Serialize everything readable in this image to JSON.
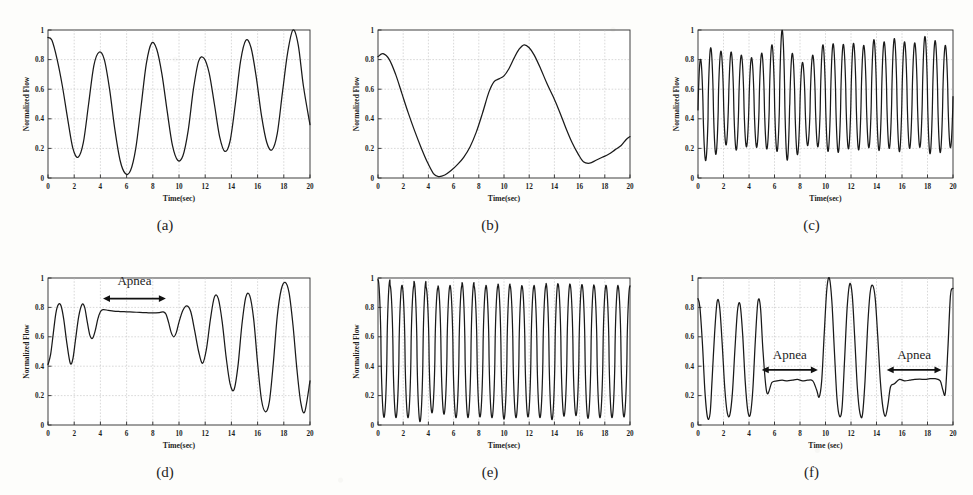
{
  "figure": {
    "background_color": "#fdfdfb",
    "trace_color": "#1a1a1a",
    "grid_color": "#b9b9b9",
    "frame_color": "#2b2b2b"
  },
  "axes_common": {
    "ylabel": "Normalized Flow",
    "xlabel": "Time(sec)",
    "xticks": [
      "0",
      "2",
      "4",
      "6",
      "8",
      "10",
      "12",
      "14",
      "16",
      "18",
      "20"
    ],
    "xtick_values": [
      0,
      2,
      4,
      6,
      8,
      10,
      12,
      14,
      16,
      18,
      20
    ],
    "yticks": [
      "0",
      "0.2",
      "0.4",
      "0.6",
      "0.8",
      "1"
    ],
    "ytick_values": [
      0,
      0.2,
      0.4,
      0.6,
      0.8,
      1
    ],
    "xlim": [
      0,
      20
    ],
    "ylim": [
      0,
      1
    ],
    "grid": true
  },
  "panels": [
    {
      "id": "a",
      "label": "(a)",
      "ylabel": "Normalized Flow",
      "xlabel": "Time(sec)",
      "show_ylabel": true,
      "annotations": [],
      "chart_data": {
        "type": "line",
        "title": "(a)",
        "xlabel": "Time(sec)",
        "ylabel": "Normalized Flow",
        "xlim": [
          0,
          20
        ],
        "ylim": [
          0,
          1
        ],
        "grid": true,
        "description": "Normal breathing, slow regular respiration, about 6 cycles in 20 seconds",
        "series": [
          {
            "name": "normalized flow",
            "x": [
              0.0,
              0.3,
              0.7,
              1.1,
              1.5,
              1.9,
              2.3,
              2.7,
              3.1,
              3.5,
              3.9,
              4.3,
              4.7,
              5.1,
              5.5,
              5.9,
              6.3,
              6.7,
              7.1,
              7.5,
              7.9,
              8.3,
              8.7,
              9.1,
              9.5,
              9.9,
              10.3,
              10.7,
              11.1,
              11.5,
              11.9,
              12.3,
              12.7,
              13.1,
              13.5,
              13.9,
              14.3,
              14.7,
              15.1,
              15.5,
              15.9,
              16.3,
              16.7,
              17.1,
              17.5,
              17.9,
              18.3,
              18.7,
              19.1,
              19.5,
              20.0
            ],
            "y": [
              0.95,
              0.93,
              0.8,
              0.62,
              0.4,
              0.2,
              0.14,
              0.24,
              0.5,
              0.76,
              0.85,
              0.8,
              0.6,
              0.33,
              0.12,
              0.03,
              0.05,
              0.2,
              0.48,
              0.77,
              0.91,
              0.87,
              0.7,
              0.45,
              0.22,
              0.12,
              0.15,
              0.32,
              0.6,
              0.79,
              0.81,
              0.71,
              0.5,
              0.28,
              0.18,
              0.25,
              0.5,
              0.79,
              0.93,
              0.88,
              0.68,
              0.42,
              0.24,
              0.19,
              0.3,
              0.58,
              0.85,
              1.0,
              0.9,
              0.62,
              0.36
            ]
          }
        ]
      }
    },
    {
      "id": "b",
      "label": "(b)",
      "ylabel": "Normalized Flow",
      "xlabel": "Time(sec)",
      "show_ylabel": true,
      "annotations": [],
      "chart_data": {
        "type": "line",
        "title": "(b)",
        "xlabel": "Time(sec)",
        "ylabel": "Normalized Flow",
        "xlim": [
          0,
          20
        ],
        "ylim": [
          0,
          1
        ],
        "grid": true,
        "description": "Very slow breathing, roughly one and a half long cycles over 20 seconds",
        "series": [
          {
            "name": "normalized flow",
            "x": [
              0.0,
              0.4,
              0.9,
              1.4,
              1.9,
              2.4,
              2.9,
              3.4,
              3.9,
              4.4,
              4.8,
              5.3,
              5.8,
              6.3,
              6.8,
              7.3,
              7.8,
              8.3,
              8.8,
              9.2,
              9.6,
              10.0,
              10.4,
              10.8,
              11.2,
              11.6,
              12.0,
              12.4,
              12.9,
              13.4,
              13.9,
              14.4,
              14.9,
              15.4,
              15.9,
              16.3,
              16.8,
              17.3,
              17.8,
              18.3,
              18.8,
              19.3,
              19.7,
              20.0
            ],
            "y": [
              0.82,
              0.84,
              0.8,
              0.7,
              0.57,
              0.44,
              0.32,
              0.21,
              0.11,
              0.03,
              0.01,
              0.02,
              0.05,
              0.09,
              0.14,
              0.21,
              0.31,
              0.44,
              0.58,
              0.65,
              0.67,
              0.69,
              0.74,
              0.81,
              0.87,
              0.9,
              0.88,
              0.83,
              0.74,
              0.64,
              0.55,
              0.45,
              0.34,
              0.24,
              0.16,
              0.11,
              0.1,
              0.12,
              0.14,
              0.16,
              0.19,
              0.22,
              0.26,
              0.28
            ]
          }
        ]
      }
    },
    {
      "id": "c",
      "label": "(c)",
      "ylabel": "Normalized Flow",
      "xlabel": "Time(sec)",
      "show_ylabel": true,
      "annotations": [],
      "chart_data": {
        "type": "line",
        "title": "(c)",
        "xlabel": "Time(sec)",
        "ylabel": "Normalized Flow",
        "xlim": [
          0,
          20
        ],
        "ylim": [
          0,
          1
        ],
        "grid": true,
        "description": "Rapid shallow breathing, about 25 fast cycles, amplitude between 0.1 and 1.0",
        "synth": {
          "mode": "oscillation",
          "cycles": 25,
          "baseline": 0.52,
          "amplitude": 0.36,
          "phase": 0.0,
          "amp_modulation": [
            0.95,
            1.0,
            0.88,
            0.92,
            0.86,
            0.84,
            0.9,
            1.0,
            1.22,
            0.95,
            0.78,
            0.86,
            1.0,
            1.02,
            0.98,
            1.0,
            0.96,
            1.04,
            1.0,
            1.06,
            1.0,
            0.98,
            1.1,
            1.05,
            0.96
          ],
          "base_modulation": [
            -0.06,
            0.0,
            0.02,
            0.0,
            0.0,
            -0.01,
            0.0,
            0.02,
            0.04,
            -0.02,
            -0.02,
            0.0,
            0.02,
            0.02,
            0.03,
            0.03,
            0.03,
            0.04,
            0.04,
            0.04,
            0.04,
            0.04,
            0.04,
            0.03,
            0.03
          ],
          "sharpness": 1.25
        }
      }
    },
    {
      "id": "d",
      "label": "(d)",
      "ylabel": "Normalized Flow",
      "xlabel": "Time(sec)",
      "show_ylabel": true,
      "annotations": [
        {
          "text": "Apnea",
          "x_start": 4.2,
          "x_end": 9.0,
          "arrow_y": 0.86,
          "label_y": 0.95
        }
      ],
      "chart_data": {
        "type": "line",
        "title": "(d)",
        "xlabel": "Time(sec)",
        "ylabel": "Normalized Flow",
        "xlim": [
          0,
          20
        ],
        "ylim": [
          0,
          1
        ],
        "grid": true,
        "description": "Hypopnea/apnea event: flat plateau near 0.77 between 4.2 and 9 seconds, followed by deep recovery breaths",
        "series": [
          {
            "name": "normalized flow",
            "x": [
              0.0,
              0.2,
              0.4,
              0.6,
              0.8,
              1.0,
              1.2,
              1.45,
              1.7,
              1.9,
              2.1,
              2.35,
              2.6,
              2.8,
              3.0,
              3.2,
              3.4,
              3.6,
              3.8,
              4.0,
              4.2,
              4.6,
              5.0,
              5.5,
              6.0,
              6.5,
              7.0,
              7.5,
              8.0,
              8.5,
              8.8,
              9.0,
              9.2,
              9.4,
              9.6,
              9.8,
              10.0,
              10.3,
              10.6,
              10.9,
              11.2,
              11.5,
              11.8,
              12.1,
              12.4,
              12.7,
              13.0,
              13.3,
              13.6,
              13.9,
              14.2,
              14.5,
              14.8,
              15.1,
              15.4,
              15.7,
              16.0,
              16.3,
              16.6,
              16.9,
              17.2,
              17.5,
              17.8,
              18.1,
              18.4,
              18.7,
              19.0,
              19.3,
              19.6,
              20.0
            ],
            "y": [
              0.41,
              0.48,
              0.62,
              0.76,
              0.82,
              0.81,
              0.72,
              0.55,
              0.42,
              0.45,
              0.58,
              0.74,
              0.82,
              0.8,
              0.7,
              0.61,
              0.59,
              0.64,
              0.72,
              0.77,
              0.785,
              0.78,
              0.775,
              0.772,
              0.77,
              0.768,
              0.766,
              0.764,
              0.762,
              0.765,
              0.77,
              0.755,
              0.7,
              0.63,
              0.6,
              0.63,
              0.7,
              0.78,
              0.81,
              0.77,
              0.64,
              0.5,
              0.42,
              0.52,
              0.72,
              0.87,
              0.86,
              0.7,
              0.46,
              0.28,
              0.24,
              0.4,
              0.68,
              0.87,
              0.88,
              0.72,
              0.42,
              0.17,
              0.09,
              0.16,
              0.42,
              0.74,
              0.92,
              0.97,
              0.9,
              0.68,
              0.38,
              0.15,
              0.09,
              0.3
            ]
          }
        ]
      }
    },
    {
      "id": "e",
      "label": "(e)",
      "ylabel": "Normalized Flow",
      "xlabel": "Time(sec)",
      "show_ylabel": true,
      "annotations": [],
      "chart_data": {
        "type": "line",
        "title": "(e)",
        "xlabel": "Time(sec)",
        "ylabel": "Normalized Flow",
        "xlim": [
          0,
          20
        ],
        "ylim": [
          0,
          1
        ],
        "grid": true,
        "description": "Regular rapid breathing with large amplitude, about 21 cycles spanning 0.05 to 0.97",
        "synth": {
          "mode": "oscillation",
          "cycles": 21,
          "baseline": 0.5,
          "amplitude": 0.45,
          "phase": 0.25,
          "amp_modulation": [
            1.04,
            1.0,
            1.0,
            1.06,
            0.95,
            0.97,
            1.0,
            1.02,
            0.99,
            1.0,
            1.02,
            1.0,
            0.99,
            1.0,
            1.03,
            1.0,
            0.99,
            1.01,
            1.0,
            1.0,
            0.99
          ],
          "base_modulation": [
            0.02,
            0.0,
            0.0,
            0.0,
            0.01,
            0.01,
            0.0,
            0.01,
            0.0,
            0.0,
            0.0,
            0.0,
            0.0,
            0.0,
            0.0,
            0.01,
            0.01,
            0.0,
            0.0,
            0.0,
            0.0
          ],
          "sharpness": 1.45
        }
      }
    },
    {
      "id": "f",
      "label": "(f)",
      "ylabel": "Normalized Flow",
      "xlabel": "Time (sec)",
      "show_ylabel": false,
      "annotations": [
        {
          "text": "Apnea",
          "x_start": 5.0,
          "x_end": 9.4,
          "arrow_y": 0.375,
          "label_y": 0.45
        },
        {
          "text": "Apnea",
          "x_start": 14.8,
          "x_end": 19.1,
          "arrow_y": 0.375,
          "label_y": 0.45
        }
      ],
      "chart_data": {
        "type": "line",
        "title": "(f)",
        "xlabel": "Time (sec)",
        "ylabel": "Normalized Flow",
        "xlim": [
          0,
          20
        ],
        "ylim": [
          0,
          1
        ],
        "grid": true,
        "description": "Two obstructive apnea episodes: flat plateaus near 0.30 from 5 to 9.4 seconds and from 14.8 to 19.1 seconds, separated by large recovery breaths",
        "series": [
          {
            "name": "normalized flow",
            "x": [
              0.0,
              0.15,
              0.35,
              0.55,
              0.75,
              0.95,
              1.1,
              1.3,
              1.5,
              1.7,
              1.9,
              2.1,
              2.3,
              2.5,
              2.7,
              2.9,
              3.1,
              3.3,
              3.5,
              3.7,
              3.9,
              4.1,
              4.3,
              4.5,
              4.7,
              4.9,
              5.1,
              5.4,
              5.8,
              6.2,
              6.6,
              7.0,
              7.4,
              7.8,
              8.2,
              8.6,
              9.0,
              9.3,
              9.5,
              9.7,
              9.9,
              10.1,
              10.3,
              10.5,
              10.7,
              10.9,
              11.1,
              11.3,
              11.5,
              11.7,
              11.9,
              12.1,
              12.3,
              12.5,
              12.7,
              12.9,
              13.1,
              13.3,
              13.5,
              13.7,
              13.9,
              14.1,
              14.3,
              14.5,
              14.7,
              14.9,
              15.1,
              15.4,
              15.8,
              16.2,
              16.6,
              17.0,
              17.4,
              17.8,
              18.2,
              18.6,
              19.0,
              19.2,
              19.4,
              19.6,
              19.8,
              20.0
            ],
            "y": [
              0.86,
              0.8,
              0.55,
              0.22,
              0.05,
              0.08,
              0.3,
              0.62,
              0.84,
              0.8,
              0.55,
              0.25,
              0.08,
              0.07,
              0.22,
              0.52,
              0.78,
              0.82,
              0.62,
              0.3,
              0.1,
              0.07,
              0.24,
              0.58,
              0.84,
              0.8,
              0.5,
              0.22,
              0.29,
              0.3,
              0.305,
              0.3,
              0.305,
              0.31,
              0.3,
              0.305,
              0.3,
              0.24,
              0.19,
              0.3,
              0.62,
              0.92,
              1.0,
              0.84,
              0.5,
              0.18,
              0.06,
              0.12,
              0.45,
              0.8,
              0.96,
              0.88,
              0.58,
              0.25,
              0.08,
              0.07,
              0.3,
              0.66,
              0.9,
              0.95,
              0.86,
              0.6,
              0.3,
              0.12,
              0.06,
              0.14,
              0.26,
              0.28,
              0.31,
              0.3,
              0.305,
              0.31,
              0.312,
              0.31,
              0.315,
              0.315,
              0.3,
              0.24,
              0.22,
              0.52,
              0.88,
              0.93
            ]
          }
        ]
      }
    }
  ]
}
